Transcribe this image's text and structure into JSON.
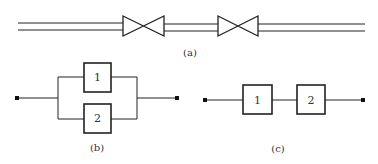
{
  "diagram": {
    "colors": {
      "stroke": "#222222",
      "text": "#333333",
      "background": "#ffffff"
    },
    "panels": [
      {
        "id": "a",
        "caption": "(a)",
        "description": "Double-line pipe with two valves in series",
        "elements": [
          "pipe",
          "valve",
          "pipe",
          "valve",
          "pipe"
        ]
      },
      {
        "id": "b",
        "caption": "(b)",
        "description": "Parallel block diagram: blocks 1 and 2 in parallel between two terminals",
        "blocks": [
          {
            "label": "1"
          },
          {
            "label": "2"
          }
        ]
      },
      {
        "id": "c",
        "caption": "(c)",
        "description": "Series block diagram: block 1 then block 2 between two terminals",
        "blocks": [
          {
            "label": "1"
          },
          {
            "label": "2"
          }
        ]
      }
    ]
  }
}
